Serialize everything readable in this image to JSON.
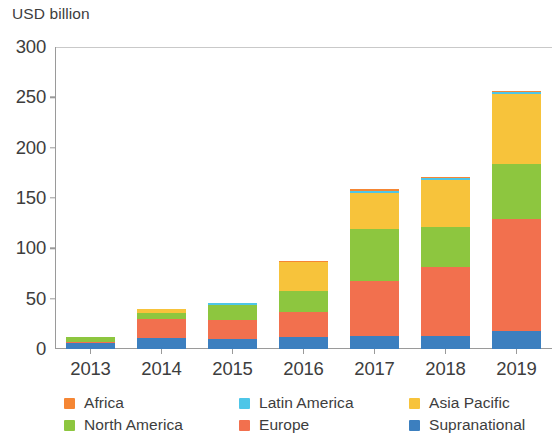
{
  "chart_data": {
    "type": "bar",
    "subtype": "stacked-bar",
    "title": "",
    "subtitle": "",
    "xlabel": "",
    "ylabel": "USD billion",
    "axis_title": "USD billion",
    "categories": [
      "2013",
      "2014",
      "2015",
      "2016",
      "2017",
      "2018",
      "2019"
    ],
    "x": [
      "2013",
      "2014",
      "2015",
      "2016",
      "2017",
      "2018",
      "2019"
    ],
    "ylim": [
      0,
      300
    ],
    "yticks": [
      0,
      50,
      100,
      150,
      200,
      250,
      300
    ],
    "ytick_labels": [
      "0",
      "50",
      "100",
      "150",
      "200",
      "250",
      "300"
    ],
    "grid": false,
    "legend_position": "bottom",
    "stack_order_bottom_to_top": [
      "Supranational",
      "Europe",
      "North America",
      "Asia Pacific",
      "Latin America",
      "Africa"
    ],
    "series": [
      {
        "name": "Supranational",
        "color": "#3c7fbf",
        "values": [
          6,
          11,
          10,
          12,
          13,
          13,
          18
        ]
      },
      {
        "name": "Europe",
        "color": "#f2704e",
        "values": [
          1,
          19,
          19,
          25,
          55,
          68,
          111
        ]
      },
      {
        "name": "North America",
        "color": "#8dc63f",
        "values": [
          5,
          6,
          15,
          21,
          51,
          40,
          55
        ]
      },
      {
        "name": "Asia Pacific",
        "color": "#f7c33b",
        "values": [
          0,
          4,
          0,
          28,
          36,
          47,
          69
        ]
      },
      {
        "name": "Latin America",
        "color": "#4ec6e8",
        "values": [
          0,
          0,
          2,
          0,
          2,
          2,
          2
        ]
      },
      {
        "name": "Africa",
        "color": "#f58634",
        "values": [
          0,
          0,
          0,
          1,
          2,
          1,
          1
        ]
      }
    ],
    "totals": [
      12,
      40,
      46,
      87,
      159,
      171,
      256
    ]
  },
  "legend": {
    "entries": [
      {
        "label": "Africa",
        "color": "#f58634"
      },
      {
        "label": "Latin America",
        "color": "#4ec6e8"
      },
      {
        "label": "Asia Pacific",
        "color": "#f7c33b"
      },
      {
        "label": "North America",
        "color": "#8dc63f"
      },
      {
        "label": "Europe",
        "color": "#f2704e"
      },
      {
        "label": "Supranational",
        "color": "#3c7fbf"
      }
    ]
  },
  "colors": {
    "africa": "#f58634",
    "latin_america": "#4ec6e8",
    "asia_pacific": "#f7c33b",
    "north_america": "#8dc63f",
    "europe": "#f2704e",
    "supranational": "#3c7fbf",
    "axis": "#9a9a9a",
    "text": "#3d3d3d",
    "background": "#ffffff"
  }
}
